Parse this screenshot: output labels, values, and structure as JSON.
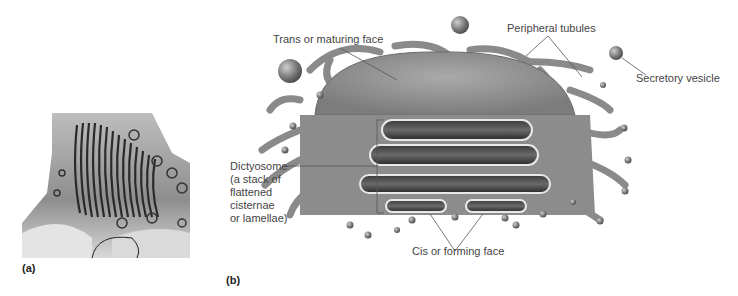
{
  "figure": {
    "panel_a": {
      "label": "(a)",
      "description": "Electron micrograph of Golgi apparatus"
    },
    "panel_b": {
      "label": "(b)",
      "description": "Three-dimensional drawing of Golgi apparatus",
      "annotations": {
        "trans_face": "Trans or maturing face",
        "peripheral_tubules": "Peripheral tubules",
        "secretory_vesicle": "Secretory vesicle",
        "dictyosome": [
          "Dictyosome",
          "(a stack of",
          "flattened",
          "cisternae",
          "or lamellae)"
        ],
        "cis_face": "Cis or forming face"
      }
    }
  }
}
